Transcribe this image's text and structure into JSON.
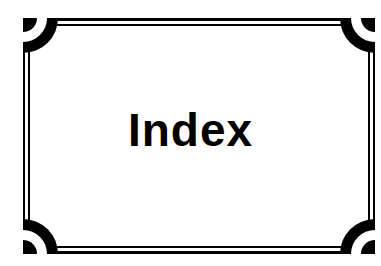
{
  "page": {
    "title": "Index"
  },
  "colors": {
    "ink": "#000000",
    "paper": "#ffffff"
  },
  "decoration": {
    "frame": "double-rule-border",
    "corners": [
      "top-left-quarter-arc",
      "top-right-quarter-arc",
      "bottom-left-quarter-arc",
      "bottom-right-quarter-arc"
    ]
  }
}
